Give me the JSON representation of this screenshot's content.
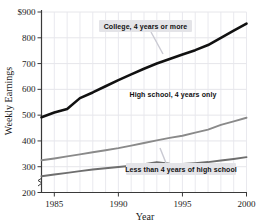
{
  "chart_data": {
    "type": "line",
    "title": "",
    "xlabel": "Year",
    "ylabel": "Weekly Earnings",
    "xlim": [
      1984,
      2000
    ],
    "ylim": [
      200,
      900
    ],
    "xticks": [
      "1985",
      "1990",
      "1995",
      "2000"
    ],
    "xtick_values": [
      1985,
      1990,
      1995,
      2000
    ],
    "yticks": [
      "$900",
      "800",
      "700",
      "600",
      "500",
      "400",
      "300",
      "200"
    ],
    "ytick_values": [
      900,
      800,
      700,
      600,
      500,
      400,
      300,
      200
    ],
    "grid": true,
    "y_axis_break": true,
    "legend_position": "inline-annotations",
    "x": [
      1984,
      1985,
      1986,
      1987,
      1988,
      1989,
      1990,
      1991,
      1992,
      1993,
      1994,
      1995,
      1996,
      1997,
      1998,
      1999,
      2000
    ],
    "series": [
      {
        "name": "College, 4 years or more",
        "color": "#111111",
        "width": 2.6,
        "values": [
          492,
          510,
          524,
          566,
          588,
          612,
          636,
          658,
          680,
          700,
          718,
          735,
          752,
          772,
          800,
          828,
          855
        ]
      },
      {
        "name": "High school, 4 years only",
        "color": "#8a8a8a",
        "width": 1.9,
        "values": [
          325,
          332,
          340,
          348,
          356,
          364,
          372,
          382,
          392,
          402,
          412,
          420,
          432,
          444,
          462,
          476,
          490
        ]
      },
      {
        "name": "Less than 4 years of high school",
        "color": "#6e6e6e",
        "width": 1.9,
        "values": [
          263,
          270,
          276,
          283,
          289,
          294,
          299,
          304,
          310,
          318,
          312,
          311,
          314,
          318,
          324,
          330,
          337
        ]
      }
    ],
    "annotations": [
      {
        "id": "college-label",
        "text": "College, 4 years or more",
        "boxed": true,
        "x": 99,
        "y": 20,
        "w": 93,
        "h": 12,
        "leader": {
          "x1": 151,
          "y1": 32,
          "x2": 163,
          "y2": 54
        }
      },
      {
        "id": "highschool-label",
        "text": "High school, 4 years only",
        "boxed": false,
        "x": 127,
        "y": 89,
        "w": 92,
        "h": 11,
        "leader": null
      },
      {
        "id": "lessthan-label",
        "text": "Less than 4 years of high school",
        "boxed": true,
        "x": 126,
        "y": 163,
        "w": 110,
        "h": 12,
        "leader": {
          "x1": 166,
          "y1": 163,
          "x2": 160,
          "y2": 148
        }
      }
    ]
  }
}
